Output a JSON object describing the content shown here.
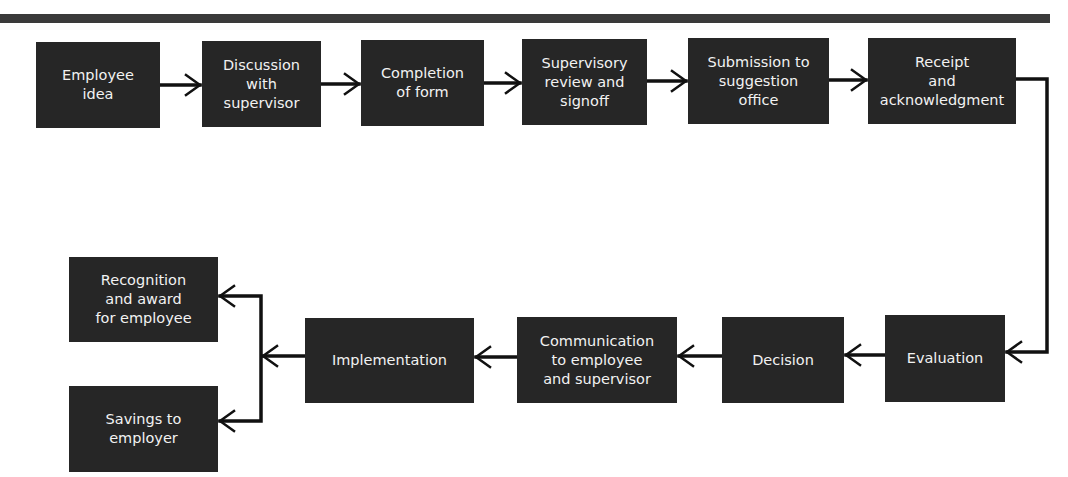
{
  "diagram": {
    "type": "flowchart",
    "colors": {
      "box_fill": "#262626",
      "box_text": "#f2f2f2",
      "line": "#111111",
      "background": "#ffffff",
      "header_rule": "#3a3a3a"
    },
    "nodes": {
      "employee_idea": "Employee\nidea",
      "discussion": "Discussion\nwith\nsupervisor",
      "completion": "Completion\nof form",
      "supervisory_review": "Supervisory\nreview and\nsignoff",
      "submission": "Submission to\nsuggestion\noffice",
      "receipt": "Receipt\nand\nacknowledgment",
      "evaluation": "Evaluation",
      "decision": "Decision",
      "communication": "Communication\nto employee\nand supervisor",
      "implementation": "Implementation",
      "recognition": "Recognition\nand award\nfor employee",
      "savings": "Savings to\nemployer"
    },
    "edges": [
      [
        "Employee idea",
        "Discussion with supervisor"
      ],
      [
        "Discussion with supervisor",
        "Completion of form"
      ],
      [
        "Completion of form",
        "Supervisory review and signoff"
      ],
      [
        "Supervisory review and signoff",
        "Submission to suggestion office"
      ],
      [
        "Submission to suggestion office",
        "Receipt and acknowledgment"
      ],
      [
        "Receipt and acknowledgment",
        "Evaluation"
      ],
      [
        "Evaluation",
        "Decision"
      ],
      [
        "Decision",
        "Communication to employee and supervisor"
      ],
      [
        "Communication to employee and supervisor",
        "Implementation"
      ],
      [
        "Implementation",
        "Recognition and award for employee"
      ],
      [
        "Implementation",
        "Savings to employer"
      ]
    ]
  }
}
